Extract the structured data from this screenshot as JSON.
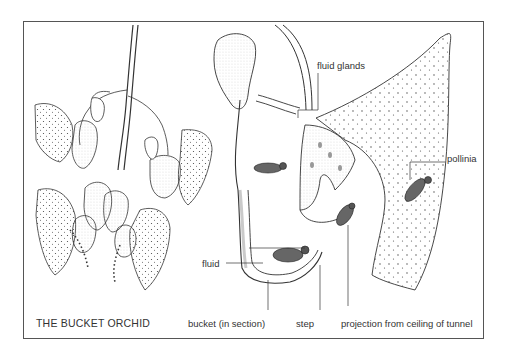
{
  "figure": {
    "title": "THE BUCKET ORCHID",
    "labels": {
      "fluid_glands": "fluid glands",
      "pollinia": "pollinia",
      "fluid": "fluid",
      "bucket": "bucket (in section)",
      "step": "step",
      "projection": "projection from ceiling of tunnel"
    },
    "colors": {
      "line": "#333333",
      "stipple": "#555555",
      "border": "#555555",
      "background": "#ffffff"
    }
  }
}
